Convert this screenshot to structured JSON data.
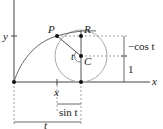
{
  "diagram": {
    "labels": {
      "y_axis": "y",
      "x_axis": "x",
      "point_p": "P",
      "point_r": "R",
      "point_c": "C",
      "angle_t": "t",
      "x_mark": "x",
      "neg_cos_t": "−cos t",
      "one": "1",
      "sin_t": "sin t",
      "t_bottom": "t"
    },
    "colors": {
      "axis": "#444444",
      "curve": "#666666",
      "circle": "#aaaaaa",
      "dashed": "#888888",
      "point": "#111111"
    }
  }
}
